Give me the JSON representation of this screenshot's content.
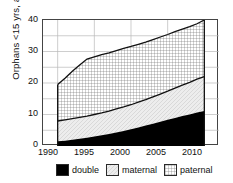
{
  "chart_data": {
    "type": "area",
    "title": "",
    "subtitle": "",
    "xlabel": "",
    "ylabel": "Orphans <15 yrs, any cause",
    "xlim": [
      1988,
      2012
    ],
    "ylim": [
      0,
      40
    ],
    "xticks": [
      1990,
      1995,
      2000,
      2005,
      2010
    ],
    "yticks": [
      0,
      10,
      20,
      30,
      40
    ],
    "gridlines": {
      "y_minor_step": 5,
      "x_at_xticks": true,
      "grid": true
    },
    "legend_position": "bottom",
    "stacked": true,
    "x": [
      1990,
      1991,
      1992,
      1993,
      1994,
      1995,
      1996,
      1997,
      1998,
      1999,
      2000,
      2001,
      2002,
      2003,
      2004,
      2005,
      2006,
      2007,
      2008,
      2009,
      2010
    ],
    "series": [
      {
        "name": "double",
        "values": [
          1.5,
          1.7,
          2.0,
          2.3,
          2.6,
          3.0,
          3.4,
          3.8,
          4.3,
          4.8,
          5.3,
          5.9,
          6.5,
          7.1,
          7.7,
          8.3,
          8.9,
          9.5,
          10.0,
          10.6,
          11.1
        ]
      },
      {
        "name": "maternal",
        "values": [
          6.5,
          6.6,
          6.7,
          6.8,
          6.9,
          7.0,
          7.1,
          7.2,
          7.4,
          7.6,
          7.8,
          8.0,
          8.2,
          8.5,
          8.8,
          9.1,
          9.5,
          9.8,
          10.2,
          10.6,
          10.9
        ]
      },
      {
        "name": "paternal",
        "values": [
          11.5,
          13.2,
          15.0,
          16.6,
          17.8,
          18.3,
          18.5,
          18.6,
          18.6,
          18.6,
          18.5,
          18.4,
          18.3,
          18.2,
          18.1,
          18.0,
          17.9,
          17.8,
          17.7,
          17.6,
          18.0
        ]
      }
    ],
    "cumulative_totals": {
      "double_top": [
        1.5,
        1.7,
        2.0,
        2.3,
        2.6,
        3.0,
        3.4,
        3.8,
        4.3,
        4.8,
        5.3,
        5.9,
        6.5,
        7.1,
        7.7,
        8.3,
        8.9,
        9.5,
        10.0,
        10.6,
        11.1
      ],
      "maternal_top": [
        8.0,
        8.3,
        8.7,
        9.1,
        9.5,
        10.0,
        10.5,
        11.0,
        11.7,
        12.4,
        13.1,
        13.9,
        14.7,
        15.6,
        16.5,
        17.4,
        18.4,
        19.3,
        20.2,
        21.2,
        22.0
      ],
      "paternal_top": [
        19.5,
        21.5,
        23.7,
        25.7,
        27.3,
        28.3,
        29.0,
        29.6,
        30.3,
        31.0,
        31.6,
        32.3,
        33.0,
        33.8,
        34.6,
        35.4,
        36.3,
        37.1,
        37.9,
        38.8,
        40.0
      ]
    },
    "legend": [
      {
        "label": "double",
        "pattern": "solid-black",
        "color": "#000000"
      },
      {
        "label": "maternal",
        "pattern": "light-hatch",
        "color": "#ebebeb"
      },
      {
        "label": "paternal",
        "pattern": "crosshatch",
        "color": "#ffffff"
      }
    ]
  },
  "axes": {
    "y_title": "Orphans <15 yrs, any cause",
    "y_tick_labels": [
      "0",
      "10",
      "20",
      "30",
      "40"
    ],
    "x_tick_labels": [
      "1990",
      "1995",
      "2000",
      "2005",
      "2010"
    ]
  },
  "legend": {
    "items": [
      {
        "label": "double"
      },
      {
        "label": "maternal"
      },
      {
        "label": "paternal"
      }
    ]
  }
}
